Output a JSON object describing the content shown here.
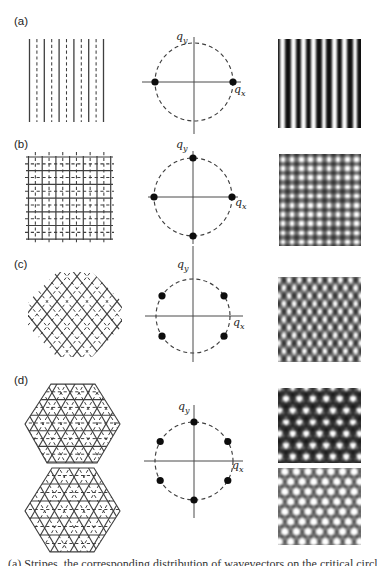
{
  "figure": {
    "axis_labels": {
      "base": "q",
      "sub_x": "x",
      "sub_y": "y"
    },
    "rows": [
      {
        "label": "(a)",
        "lattice_type": "stripes",
        "qspace": {
          "dot_angles_deg": [
            0,
            180
          ]
        },
        "pattern_type": "vertical-stripes"
      },
      {
        "label": "(b)",
        "lattice_type": "square-grid",
        "qspace": {
          "dot_angles_deg": [
            0,
            90,
            180,
            270
          ]
        },
        "pattern_type": "square-lattice"
      },
      {
        "label": "(c)",
        "lattice_type": "rhombic",
        "qspace": {
          "dot_angles_deg": [
            33,
            147,
            213,
            327
          ]
        },
        "pattern_type": "rhombic-lattice"
      },
      {
        "label": "(d)",
        "lattice_type": "triangular",
        "qspace": {
          "dot_angles_deg": [
            30,
            90,
            150,
            210,
            270,
            330
          ]
        },
        "pattern_type": "hexagonal-dark",
        "pattern_type_2": "hexagonal-light"
      }
    ],
    "caption_fragment": "(a) Stripes, the corresponding distribution of wavevectors on the critical circle, and the resulting intensity pattern;"
  },
  "colors": {
    "background": "#ffffff",
    "line_ink": "#3f3f3f",
    "axis_ink": "#4a4a4a",
    "dot_ink": "#0d0d0d",
    "pattern_dark": "#101010"
  }
}
